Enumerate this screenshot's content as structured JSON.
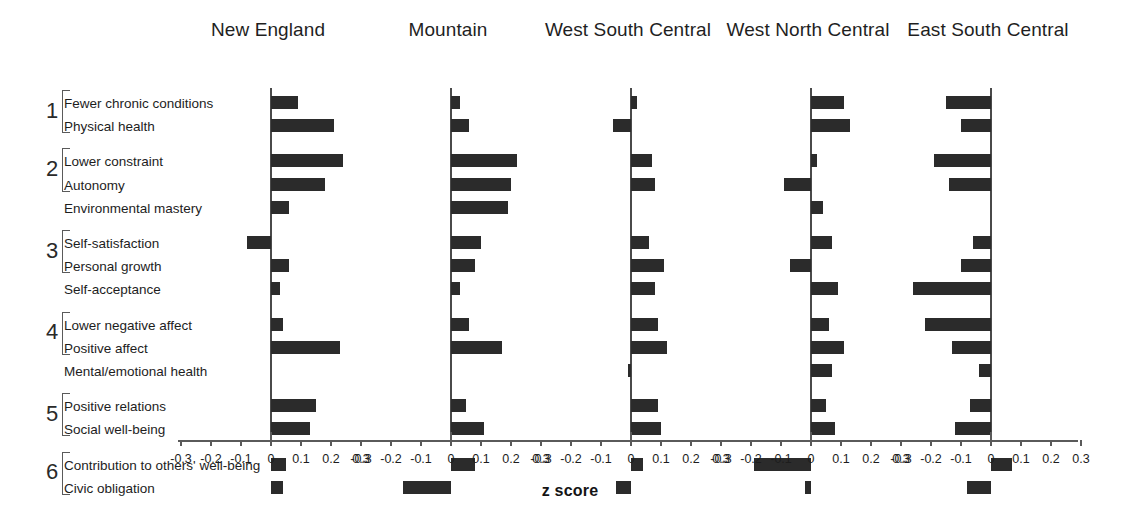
{
  "chart_data": {
    "type": "bar",
    "orientation": "horizontal",
    "title": "",
    "xlabel": "z score",
    "ylabel": "",
    "xlim": [
      -0.3,
      0.3
    ],
    "xticks": [
      -0.3,
      -0.2,
      -0.1,
      0,
      0.1,
      0.2,
      0.3
    ],
    "xticklabels": [
      "-0.3",
      "-0.2",
      "-0.1",
      "0",
      "0.1",
      "0.2",
      "0.3"
    ],
    "grid": false,
    "legend": false,
    "bar_color": "#2b2b2b",
    "zero_line": true,
    "panels": [
      "New England",
      "Mountain",
      "West South Central",
      "West North Central",
      "East South Central"
    ],
    "groups": [
      {
        "number": "1",
        "items": [
          "Fewer chronic conditions",
          "Physical health"
        ]
      },
      {
        "number": "2",
        "items": [
          "Lower constraint",
          "Autonomy",
          "Environmental mastery"
        ]
      },
      {
        "number": "3",
        "items": [
          "Self-satisfaction",
          "Personal growth",
          "Self-acceptance"
        ]
      },
      {
        "number": "4",
        "items": [
          "Lower negative affect",
          "Positive affect",
          "Mental/emotional health"
        ]
      },
      {
        "number": "5",
        "items": [
          "Positive relations",
          "Social well-being"
        ]
      },
      {
        "number": "6",
        "items": [
          "Contribution to others' well-being",
          "Civic obligation"
        ]
      }
    ],
    "categories": [
      "Fewer chronic conditions",
      "Physical health",
      "Lower constraint",
      "Autonomy",
      "Environmental mastery",
      "Self-satisfaction",
      "Personal growth",
      "Self-acceptance",
      "Lower negative affect",
      "Positive affect",
      "Mental/emotional health",
      "Positive relations",
      "Social well-being",
      "Contribution to others' well-being",
      "Civic obligation"
    ],
    "series": [
      {
        "name": "New England",
        "values": [
          0.09,
          0.21,
          0.24,
          0.18,
          0.06,
          -0.08,
          0.06,
          0.03,
          0.04,
          0.23,
          0.0,
          0.15,
          0.13,
          0.05,
          0.04
        ]
      },
      {
        "name": "Mountain",
        "values": [
          0.03,
          0.06,
          0.22,
          0.2,
          0.19,
          0.1,
          0.08,
          0.03,
          0.06,
          0.17,
          0.0,
          0.05,
          0.11,
          0.08,
          -0.16
        ]
      },
      {
        "name": "West South Central",
        "values": [
          0.02,
          -0.06,
          0.07,
          0.08,
          0.0,
          0.06,
          0.11,
          0.08,
          0.09,
          0.12,
          -0.01,
          0.09,
          0.1,
          0.04,
          -0.05
        ]
      },
      {
        "name": "West North Central",
        "values": [
          0.11,
          0.13,
          0.02,
          -0.09,
          0.04,
          0.07,
          -0.07,
          0.09,
          0.06,
          0.11,
          0.07,
          0.05,
          0.08,
          -0.19,
          -0.02
        ]
      },
      {
        "name": "East South Central",
        "values": [
          -0.15,
          -0.1,
          -0.19,
          -0.14,
          0.0,
          -0.06,
          -0.1,
          -0.26,
          -0.22,
          -0.13,
          -0.04,
          -0.07,
          -0.12,
          0.07,
          -0.08
        ]
      }
    ]
  }
}
